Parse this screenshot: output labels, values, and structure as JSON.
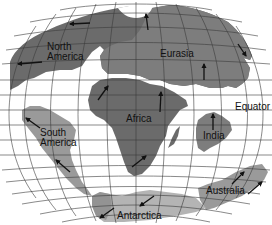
{
  "map": {
    "type": "plate tectonics / continental drift world map",
    "colors": {
      "background": "#ffffff",
      "land_dark": "#6b6b6b",
      "land_mid": "#7d7d7d",
      "land_light": "#9a9a9a",
      "grid": "#3a3a3a",
      "text": "#111111"
    },
    "labels": {
      "north_america": [
        "North",
        "America"
      ],
      "eurasia": "Eurasia",
      "africa": "Africa",
      "south_america": [
        "South",
        "America"
      ],
      "india": "India",
      "australia": "Australia",
      "antarctica": "Antarctica",
      "equator": "Equator"
    },
    "arrows": [
      {
        "continent": "North America",
        "direction": "west",
        "count": 2
      },
      {
        "continent": "Eurasia",
        "direction": "north",
        "count": 3
      },
      {
        "continent": "Africa",
        "direction": "north/northeast",
        "count": 3
      },
      {
        "continent": "South America",
        "direction": "northwest",
        "count": 2
      },
      {
        "continent": "India",
        "direction": "north",
        "count": 1
      },
      {
        "continent": "Australia",
        "direction": "northeast",
        "count": 2
      },
      {
        "continent": "Antarctica",
        "direction": "southwest",
        "count": 2
      }
    ]
  }
}
